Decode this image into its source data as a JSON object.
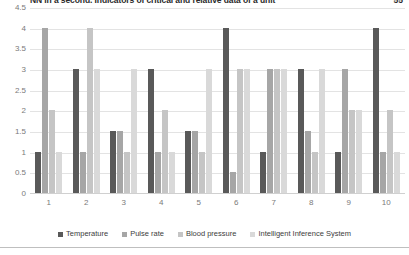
{
  "caption": {
    "text": "NN in a second. Indicators of critical and relative data of a unit",
    "page": "55"
  },
  "chart_data": {
    "type": "bar",
    "title": "",
    "xlabel": "",
    "ylabel": "",
    "ylim": [
      0,
      4.5
    ],
    "grid": true,
    "legend_position": "bottom",
    "categories": [
      "1",
      "2",
      "3",
      "4",
      "5",
      "6",
      "7",
      "8",
      "9",
      "10"
    ],
    "yticks": [
      "4.5",
      "4",
      "3.5",
      "3",
      "2.5",
      "2",
      "1.5",
      "1",
      "0.5",
      "0"
    ],
    "series": [
      {
        "name": "Temperature",
        "color": "#595959",
        "values": [
          1,
          3,
          1.5,
          3,
          1.5,
          4,
          1,
          3,
          1,
          4
        ]
      },
      {
        "name": "Pulse rate",
        "color": "#a6a6a6",
        "values": [
          4,
          1,
          1.5,
          1,
          1.5,
          0.5,
          3,
          1.5,
          3,
          1
        ]
      },
      {
        "name": "Blood pressure",
        "color": "#c5c5c5",
        "values": [
          2,
          4,
          1,
          2,
          1,
          3,
          3,
          1,
          2,
          2
        ]
      },
      {
        "name": "Intelligent Inference System",
        "color": "#d9d9d9",
        "values": [
          1,
          3,
          3,
          1,
          3,
          3,
          3,
          3,
          2,
          1
        ]
      }
    ]
  }
}
